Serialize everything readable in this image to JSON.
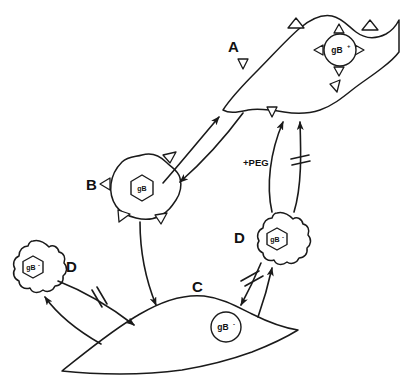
{
  "figure": {
    "background_color": "#ffffff",
    "stroke_color": "#1a1a1a",
    "width": 400,
    "height": 381
  },
  "panels": [
    {
      "id": "A",
      "label": "A",
      "label_x": 228,
      "label_y": 52,
      "cell_type": "syncytium",
      "description": "Large fused multinucleate spindle cell with surface spikes",
      "nucleus": {
        "shape": "circle",
        "label_base": "gB",
        "label_sup": "+",
        "label_full": "gB+",
        "cx": 340,
        "cy": 50,
        "r": 16
      }
    },
    {
      "id": "B",
      "label": "B",
      "label_x": 92,
      "label_y": 190,
      "cell_type": "rounded-spiky",
      "description": "Rounded spiky effector cell with hexagonal nucleus",
      "nucleus": {
        "shape": "hexagon",
        "label_base": "gB",
        "label_sup": "",
        "label_full": "gB",
        "cx": 142,
        "cy": 188,
        "r": 13
      }
    },
    {
      "id": "C",
      "label": "C",
      "label_x": 198,
      "label_y": 292,
      "cell_type": "smooth-spindle",
      "description": "Smooth elongated spindle target cell",
      "nucleus": {
        "shape": "circle",
        "label_base": "gB",
        "label_sup": "-",
        "label_full": "gB-",
        "cx": 226,
        "cy": 327,
        "r": 15
      }
    },
    {
      "id": "D-right",
      "label": "D",
      "label_x": 240,
      "label_y": 242,
      "cell_type": "lobed-round",
      "description": "Lobed round cell with hexagonal nucleus",
      "nucleus": {
        "shape": "hexagon",
        "label_base": "gB",
        "label_sup": "-",
        "label_full": "gB-",
        "cx": 277,
        "cy": 239,
        "r": 12
      }
    },
    {
      "id": "D-left",
      "label": "D",
      "label_x": 72,
      "label_y": 270,
      "cell_type": "lobed-round",
      "description": "Lobed round cell with hexagonal nucleus",
      "nucleus": {
        "shape": "hexagon",
        "label_base": "gB",
        "label_sup": "-",
        "label_full": "gB-",
        "cx": 33,
        "cy": 267,
        "r": 12
      }
    }
  ],
  "annotations": [
    {
      "id": "peg",
      "text": "+PEG",
      "x": 245,
      "y": 165,
      "meaning": "polyethylene glycol treatment promotes fusion"
    }
  ],
  "arrows": [
    {
      "id": "b-to-a",
      "from": "B",
      "to": "A",
      "blocked": false,
      "style": "curved"
    },
    {
      "id": "a-to-b",
      "from": "A",
      "to": "B",
      "blocked": false,
      "style": "curved"
    },
    {
      "id": "b-to-c",
      "from": "B",
      "to": "C",
      "blocked": false,
      "style": "curved"
    },
    {
      "id": "dright-to-a-peg",
      "from": "D-right",
      "to": "A",
      "blocked": false,
      "style": "curved",
      "label": "+PEG"
    },
    {
      "id": "dright-to-a-blocked",
      "from": "D-right",
      "to": "A",
      "blocked": true,
      "style": "curved"
    },
    {
      "id": "dright-to-c-blocked",
      "from": "D-right",
      "to": "C",
      "blocked": true,
      "style": "straight"
    },
    {
      "id": "c-to-dright",
      "from": "C",
      "to": "D-right",
      "blocked": false,
      "style": "curved"
    },
    {
      "id": "dleft-to-c-blocked",
      "from": "D-left",
      "to": "C",
      "blocked": true,
      "style": "curved"
    },
    {
      "id": "c-to-dleft",
      "from": "C",
      "to": "D-left",
      "blocked": false,
      "style": "curved"
    }
  ]
}
